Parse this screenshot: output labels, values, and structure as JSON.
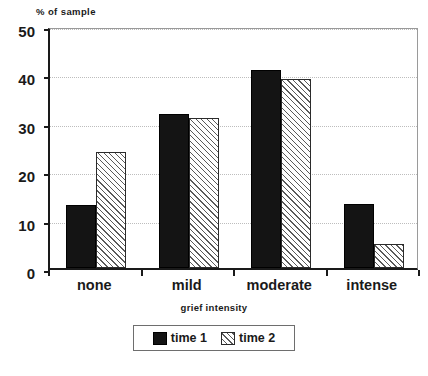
{
  "chart_data": {
    "type": "bar",
    "title": "",
    "categories": [
      "none",
      "mild",
      "moderate",
      "intense"
    ],
    "series": [
      {
        "name": "time 1",
        "values": [
          13,
          31.8,
          41,
          13.3
        ],
        "color": "#141414",
        "fill": "solid"
      },
      {
        "name": "time 2",
        "values": [
          24,
          31,
          39,
          5
        ],
        "color": "#ffffff",
        "fill": "diagonal-hatch"
      }
    ],
    "xlabel": "grief intensity",
    "ylabel": "% of sample",
    "ylim": [
      0,
      50
    ],
    "yticks": [
      0,
      10,
      20,
      30,
      40,
      50
    ],
    "ytick_labels": [
      "0",
      "10",
      "20",
      "30",
      "40",
      "50"
    ],
    "grid": true,
    "grid_axis": "y",
    "grid_style": "dotted",
    "legend_position": "bottom-center",
    "legend_entries": [
      "time 1",
      "time 2"
    ]
  },
  "caption": {
    "text": ""
  }
}
